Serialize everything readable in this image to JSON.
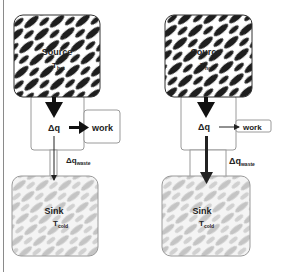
{
  "diagrams": [
    {
      "id": "left",
      "source": {
        "label": "Source",
        "temp_main": "T",
        "temp_sub": "hot"
      },
      "middle": {
        "label": "Δq"
      },
      "work": {
        "label": "work",
        "arrow": "thick"
      },
      "waste": {
        "label_main": "Δq",
        "label_sub": "waste",
        "arrow": "thin"
      },
      "sink": {
        "label": "Sink",
        "temp_main": "T",
        "temp_sub": "cold"
      }
    },
    {
      "id": "right",
      "source": {
        "label": "Source",
        "temp_main": "T",
        "temp_sub": "hot"
      },
      "middle": {
        "label": "Δq"
      },
      "work": {
        "label": "work",
        "arrow": "thin"
      },
      "waste": {
        "label_main": "Δq",
        "label_sub": "waste",
        "arrow": "thick"
      },
      "sink": {
        "label": "Sink",
        "temp_main": "T",
        "temp_sub": "cold"
      }
    }
  ],
  "colors": {
    "hot_stripe": "#1e1e1e",
    "cold_stripe": "#bdbdbd",
    "box_border": "#9a9a9a",
    "text": "#222222"
  }
}
